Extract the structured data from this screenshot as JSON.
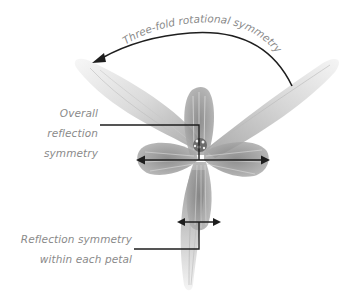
{
  "diagram": {
    "colors": {
      "line": "#1e1e1e",
      "label_text": "#8a8a8a",
      "petal_fill": "#9a9a9a",
      "background": "#ffffff"
    },
    "annotations": {
      "rotational": {
        "text": "Three-fold rotational symmetry"
      },
      "overall_reflection": {
        "line1": "Overall",
        "line2": "reflection",
        "line3": "symmetry"
      },
      "petal_reflection": {
        "line1": "Reflection symmetry",
        "line2": "within each petal"
      }
    }
  }
}
